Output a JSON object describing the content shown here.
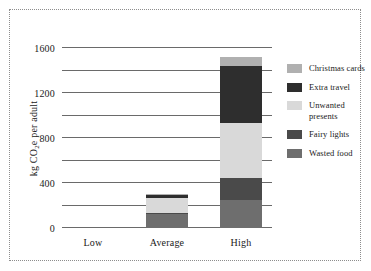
{
  "chart_data": {
    "type": "bar",
    "subtype": "stacked-bar",
    "title": "",
    "xlabel": "",
    "ylabel": "kg CO2e per adult",
    "ylabel_parts": {
      "pre": "kg CO",
      "sub": "2",
      "post": "e per adult"
    },
    "categories": [
      "Low",
      "Average",
      "High"
    ],
    "ylim": [
      0,
      1600
    ],
    "yticks": [
      0,
      400,
      800,
      1200,
      1600
    ],
    "yticklabels": [
      "0",
      "400",
      "800",
      "1200",
      "1600"
    ],
    "minor_gridlines": [
      200,
      600,
      1000,
      1400
    ],
    "grid": true,
    "legend_position": "right",
    "series": [
      {
        "name": "Wasted food",
        "color": "#6e6e6e",
        "values": [
          0,
          125,
          250
        ]
      },
      {
        "name": "Fairy lights",
        "color": "#4a4a4a",
        "values": [
          0,
          10,
          195
        ]
      },
      {
        "name": "Unwanted presents",
        "color": "#d9d9d9",
        "values": [
          0,
          135,
          490
        ]
      },
      {
        "name": "Extra travel",
        "color": "#2e2e2e",
        "values": [
          0,
          25,
          505
        ]
      },
      {
        "name": "Christmas cards",
        "color": "#b0b0b0",
        "values": [
          0,
          10,
          80
        ]
      }
    ],
    "totals": [
      0,
      305,
      1520
    ],
    "legend_order": [
      "Christmas cards",
      "Extra travel",
      "Unwanted presents",
      "Fairy lights",
      "Wasted food"
    ]
  },
  "legend": {
    "items": [
      {
        "label": "Christmas cards",
        "color": "#b0b0b0"
      },
      {
        "label": "Extra travel",
        "color": "#2e2e2e"
      },
      {
        "label": "Unwanted presents",
        "color": "#d9d9d9"
      },
      {
        "label": "Fairy lights",
        "color": "#4a4a4a"
      },
      {
        "label": "Wasted food",
        "color": "#6e6e6e"
      }
    ]
  },
  "style": {
    "border_color": "#8d8d8d",
    "axis_color": "#6a6a6a",
    "text_color": "#1a1a1a",
    "background": "#ffffff"
  }
}
